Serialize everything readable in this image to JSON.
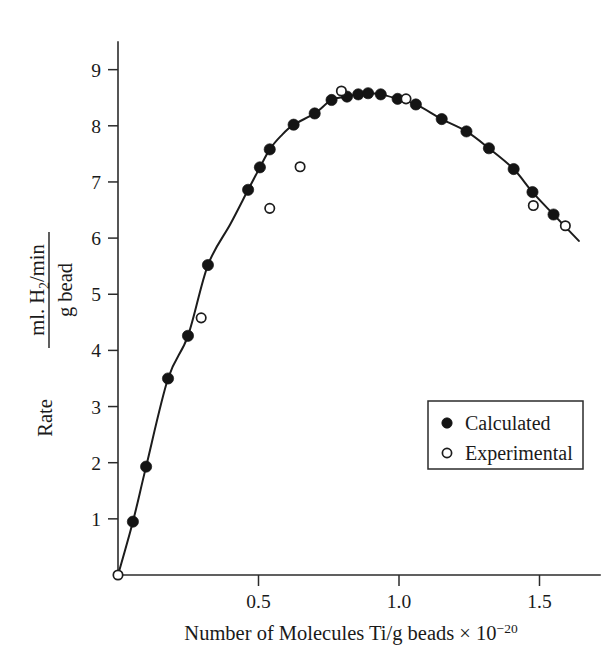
{
  "chart_data": {
    "type": "scatter",
    "title": "",
    "xlabel": "Number of Molecules Ti/g beads × 10⁻²⁰",
    "xlabel_parts": {
      "main": "Number of Molecules Ti/g beads × 10",
      "exponent": "−20"
    },
    "ylabel": "Rate  ml. H₂/min / g bead",
    "ylabel_parts": {
      "prefix": "Rate",
      "numerator_pre": "ml. H",
      "numerator_sub": "2",
      "numerator_post": "/min",
      "denominator": "g bead"
    },
    "xlim": [
      0.0,
      1.72
    ],
    "ylim": [
      0,
      9.6
    ],
    "xticks": [
      0.5,
      1.0,
      1.5
    ],
    "xtick_labels": [
      "0.5",
      "1.0",
      "1.5"
    ],
    "yticks": [
      1,
      2,
      3,
      4,
      5,
      6,
      7,
      8,
      9
    ],
    "ytick_labels": [
      "1",
      "2",
      "3",
      "4",
      "5",
      "6",
      "7",
      "8",
      "9"
    ],
    "grid": false,
    "legend_position": "lower-right",
    "axis_color": "#2b2b2b",
    "curve_color": "#1c1c1c",
    "series": [
      {
        "name": "Calculated",
        "marker": "filled-circle",
        "color": "#141414",
        "points": [
          [
            0.053,
            0.95
          ],
          [
            0.1,
            1.93
          ],
          [
            0.178,
            3.5
          ],
          [
            0.249,
            4.26
          ],
          [
            0.32,
            5.52
          ],
          [
            0.463,
            6.86
          ],
          [
            0.505,
            7.26
          ],
          [
            0.54,
            7.58
          ],
          [
            0.625,
            8.02
          ],
          [
            0.7,
            8.22
          ],
          [
            0.76,
            8.46
          ],
          [
            0.815,
            8.52
          ],
          [
            0.855,
            8.56
          ],
          [
            0.89,
            8.58
          ],
          [
            0.935,
            8.56
          ],
          [
            0.995,
            8.48
          ],
          [
            1.06,
            8.38
          ],
          [
            1.152,
            8.12
          ],
          [
            1.24,
            7.9
          ],
          [
            1.32,
            7.6
          ],
          [
            1.408,
            7.23
          ],
          [
            1.475,
            6.82
          ],
          [
            1.55,
            6.42
          ]
        ]
      },
      {
        "name": "Experimental",
        "marker": "open-circle",
        "color": "#1c1c1c",
        "points": [
          [
            0.0,
            0.0
          ],
          [
            0.296,
            4.58
          ],
          [
            0.54,
            6.53
          ],
          [
            0.648,
            7.27
          ],
          [
            0.795,
            8.62
          ],
          [
            1.025,
            8.48
          ],
          [
            1.478,
            6.58
          ],
          [
            1.592,
            6.22
          ]
        ]
      }
    ],
    "curve": [
      [
        0.0,
        0.0
      ],
      [
        0.053,
        0.95
      ],
      [
        0.1,
        1.93
      ],
      [
        0.178,
        3.5
      ],
      [
        0.249,
        4.26
      ],
      [
        0.32,
        5.52
      ],
      [
        0.4,
        6.25
      ],
      [
        0.463,
        6.86
      ],
      [
        0.505,
        7.26
      ],
      [
        0.54,
        7.58
      ],
      [
        0.58,
        7.82
      ],
      [
        0.625,
        8.02
      ],
      [
        0.7,
        8.22
      ],
      [
        0.76,
        8.46
      ],
      [
        0.815,
        8.52
      ],
      [
        0.855,
        8.56
      ],
      [
        0.89,
        8.58
      ],
      [
        0.935,
        8.56
      ],
      [
        0.995,
        8.48
      ],
      [
        1.06,
        8.38
      ],
      [
        1.152,
        8.12
      ],
      [
        1.24,
        7.9
      ],
      [
        1.32,
        7.6
      ],
      [
        1.408,
        7.23
      ],
      [
        1.475,
        6.82
      ],
      [
        1.55,
        6.42
      ],
      [
        1.64,
        5.95
      ]
    ]
  },
  "legend": {
    "items": [
      {
        "label": "Calculated",
        "marker": "filled-circle"
      },
      {
        "label": "Experimental",
        "marker": "open-circle"
      }
    ]
  }
}
